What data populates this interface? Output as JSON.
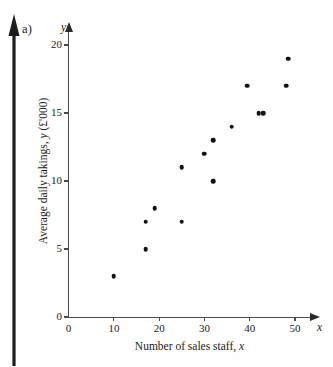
{
  "part_label": "a)",
  "margin_arrow_icon": "up-arrow-icon",
  "chart_data": {
    "type": "scatter",
    "title": "",
    "xlabel": "Number of sales staff, x",
    "ylabel": "Average daily takings, y (£'000)",
    "xlabel_main": "Number of sales staff,",
    "xlabel_var": "x",
    "ylabel_main": "Average daily takings,",
    "ylabel_var": "y",
    "ylabel_units": "(£'000)",
    "x_axis_symbol": "x",
    "y_axis_symbol": "y",
    "xlim": [
      0,
      53
    ],
    "ylim": [
      0,
      21
    ],
    "xticks": [
      0,
      10,
      20,
      30,
      40,
      50
    ],
    "yticks": [
      0,
      5,
      10,
      15,
      20
    ],
    "xtick_labels": [
      "0",
      "10",
      "20",
      "30",
      "40",
      "50"
    ],
    "ytick_labels": [
      "0",
      "5",
      "10",
      "15",
      "20"
    ],
    "grid": false,
    "legend": false,
    "marker": "filled-circle",
    "marker_color": "#111111",
    "axis_color": "#4a4a4a",
    "points": [
      {
        "x": 10,
        "y": 3
      },
      {
        "x": 17,
        "y": 5
      },
      {
        "x": 17,
        "y": 7
      },
      {
        "x": 19,
        "y": 8
      },
      {
        "x": 25,
        "y": 7
      },
      {
        "x": 25,
        "y": 11
      },
      {
        "x": 30,
        "y": 12
      },
      {
        "x": 32,
        "y": 13
      },
      {
        "x": 32,
        "y": 10
      },
      {
        "x": 36,
        "y": 14
      },
      {
        "x": 39.5,
        "y": 17
      },
      {
        "x": 42,
        "y": 15
      },
      {
        "x": 43,
        "y": 15
      },
      {
        "x": 48,
        "y": 17
      },
      {
        "x": 48.5,
        "y": 19
      }
    ]
  }
}
